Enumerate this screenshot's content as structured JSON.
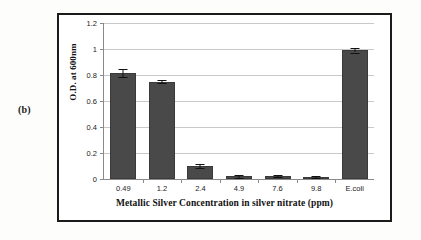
{
  "figure": {
    "panel_label": "(b)"
  },
  "chart_data": {
    "type": "bar",
    "title": "",
    "xlabel": "Metallic Silver Concentration in silver nitrate (ppm)",
    "ylabel": "O.D. at 600nm",
    "categories": [
      "0.49",
      "1.2",
      "2.4",
      "4.9",
      "7.6",
      "9.8",
      "E.coli"
    ],
    "values": [
      0.815,
      0.75,
      0.1,
      0.022,
      0.02,
      0.018,
      0.99
    ],
    "errors": [
      0.028,
      0.012,
      0.018,
      0.012,
      0.008,
      0.008,
      0.017
    ],
    "ylim": [
      0,
      1.2
    ],
    "yticks": [
      "0",
      "0.2",
      "0.4",
      "0.6",
      "0.8",
      "1",
      "1.2"
    ],
    "ytick_values": [
      0,
      0.2,
      0.4,
      0.6,
      0.8,
      1,
      1.2
    ],
    "grid": true,
    "legend": "none",
    "bar_color": "#494949",
    "grid_color": "#c9c9c9",
    "axis_color": "#8a8a8a"
  }
}
